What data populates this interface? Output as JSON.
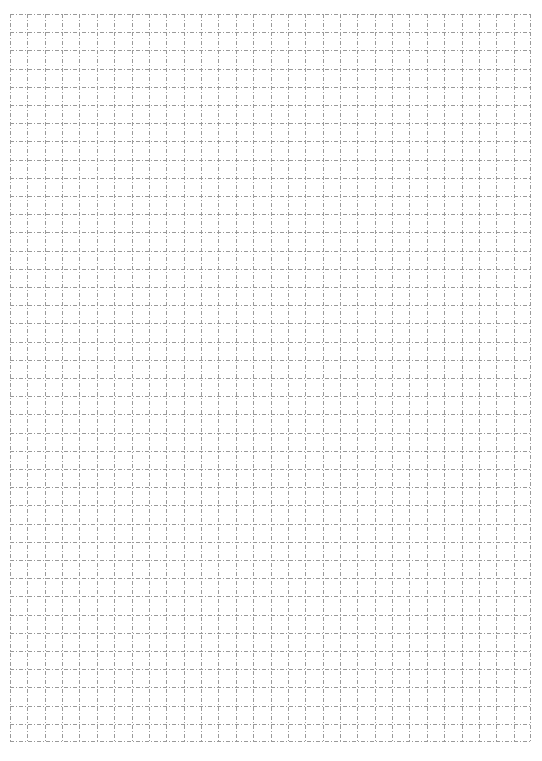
{
  "header": {
    "text": "— — — — — — — — — —"
  },
  "grid": {
    "columns": 30,
    "rows": 40,
    "line_color": "#9a9a9a",
    "line_style": "dash-dot",
    "background": "#ffffff"
  }
}
